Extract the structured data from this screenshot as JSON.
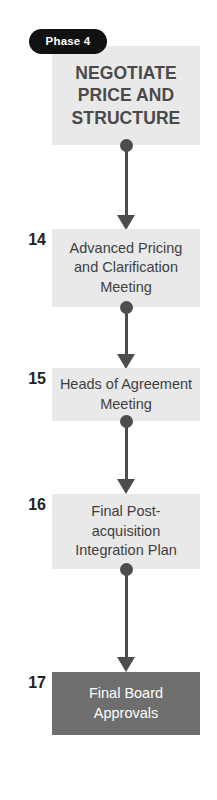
{
  "diagram": {
    "phase_badge": {
      "label": "Phase 4"
    },
    "header": {
      "title": "NEGOTIATE PRICE AND STRUCTURE",
      "background_color": "#e9e9e9",
      "text_color": "#4a4a4a"
    },
    "steps": [
      {
        "number": "14",
        "label": "Advanced Pricing and Clarification Meeting",
        "style": "light",
        "background_color": "#e9e9e9",
        "text_color": "#3f3f3f"
      },
      {
        "number": "15",
        "label": "Heads of Agreement Meeting",
        "style": "light",
        "background_color": "#e9e9e9",
        "text_color": "#3f3f3f"
      },
      {
        "number": "16",
        "label": "Final Post-acquisition Integration Plan",
        "style": "light",
        "background_color": "#e9e9e9",
        "text_color": "#3f3f3f"
      },
      {
        "number": "17",
        "label": "Final Board Approvals",
        "style": "dark",
        "background_color": "#6e6e6e",
        "text_color": "#ffffff"
      }
    ],
    "connectors": {
      "color": "#4d4d4d",
      "count": 4,
      "marker_start": "dot",
      "marker_end": "arrowhead",
      "direction": "downward"
    },
    "badge_colors": {
      "background": "#111111",
      "text": "#ffffff"
    }
  }
}
